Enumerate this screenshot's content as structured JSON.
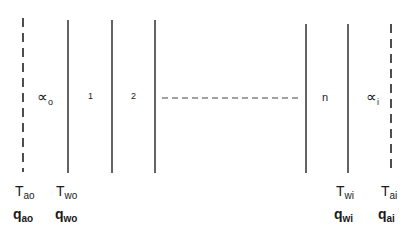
{
  "diagram": {
    "regions": {
      "outer_coefficient": {
        "symbol": "∝",
        "subscript": "o"
      },
      "layer_1": "1",
      "layer_2": "2",
      "layer_n": "n",
      "inner_coefficient": {
        "symbol": "∝",
        "subscript": "i"
      }
    },
    "boundaries": [
      {
        "id": "air-outside",
        "style": "dashed",
        "T": {
          "symbol": "T",
          "subscript": "ao"
        },
        "q": {
          "symbol": "q",
          "subscript": "ao"
        }
      },
      {
        "id": "wall-outside",
        "style": "solid",
        "T": {
          "symbol": "T",
          "subscript": "wo"
        },
        "q": {
          "symbol": "q",
          "subscript": "wo"
        }
      },
      {
        "id": "wall-1-2",
        "style": "solid"
      },
      {
        "id": "wall-2-3",
        "style": "solid"
      },
      {
        "id": "wall-n-1-n",
        "style": "solid"
      },
      {
        "id": "wall-inside",
        "style": "solid",
        "T": {
          "symbol": "T",
          "subscript": "wi"
        },
        "q": {
          "symbol": "q",
          "subscript": "wi"
        }
      },
      {
        "id": "air-inside",
        "style": "dashed",
        "T": {
          "symbol": "T",
          "subscript": "ai"
        },
        "q": {
          "symbol": "q",
          "subscript": "ai"
        }
      }
    ],
    "continuation": "dashed-ellipsis"
  }
}
